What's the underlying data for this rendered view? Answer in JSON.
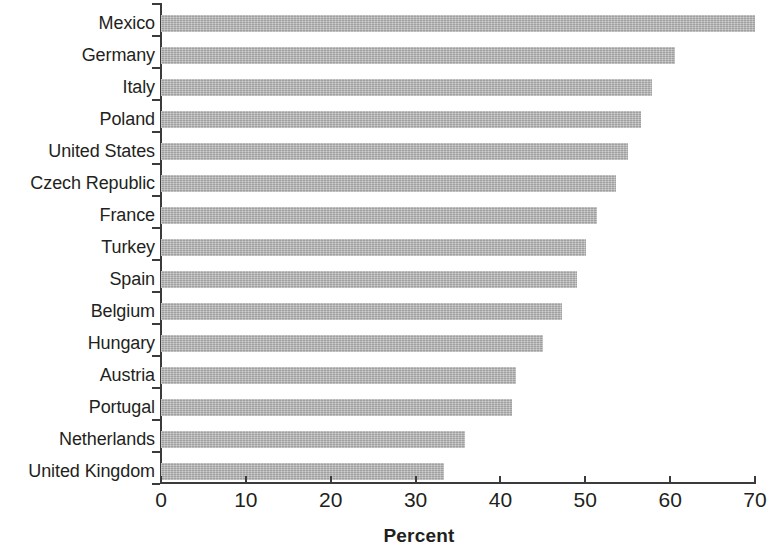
{
  "chart_data": {
    "type": "bar",
    "orientation": "horizontal",
    "title": "",
    "xlabel": "Percent",
    "ylabel": "",
    "xlim": [
      0,
      70
    ],
    "xticks": [
      0,
      10,
      20,
      30,
      40,
      50,
      60,
      70
    ],
    "grid": false,
    "legend": null,
    "bar_color": "#b3b3b3",
    "axis_color": "#3b3b3b",
    "text_color": "#231f20",
    "categories": [
      "Mexico",
      "Germany",
      "Italy",
      "Poland",
      "United States",
      "Czech Republic",
      "France",
      "Turkey",
      "Spain",
      "Belgium",
      "Hungary",
      "Austria",
      "Portugal",
      "Netherlands",
      "United Kingdom"
    ],
    "values": [
      70.0,
      60.6,
      57.9,
      56.6,
      55.0,
      53.6,
      51.4,
      50.1,
      49.0,
      47.3,
      45.0,
      41.8,
      41.4,
      35.8,
      33.3
    ]
  }
}
